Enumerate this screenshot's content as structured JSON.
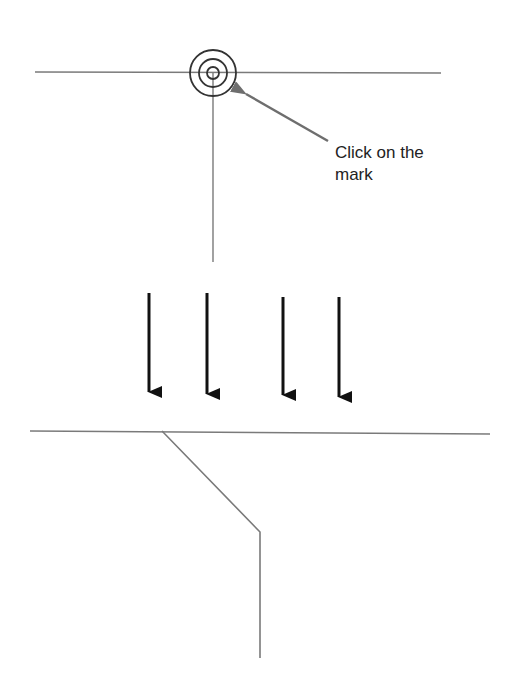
{
  "diagram": {
    "annotation": {
      "line1": "Click on the",
      "line2": "mark"
    },
    "elements": {
      "top_line": {
        "x1": 35,
        "y1": 72,
        "x2": 441,
        "y2": 73
      },
      "target_mark": {
        "cx": 213,
        "cy": 73,
        "radii": [
          23,
          14,
          6
        ]
      },
      "stem_line": {
        "x1": 213,
        "y1": 73,
        "x2": 213,
        "y2": 262
      },
      "pointer_arrow": {
        "x1": 328,
        "y1": 141,
        "x2": 240,
        "y2": 90
      },
      "down_arrows": [
        {
          "x": 149,
          "y1": 293,
          "y2": 405
        },
        {
          "x": 207,
          "y1": 293,
          "y2": 407
        },
        {
          "x": 283,
          "y1": 297,
          "y2": 408
        },
        {
          "x": 339,
          "y1": 297,
          "y2": 410
        }
      ],
      "bottom_line": {
        "x1": 30,
        "y1": 431,
        "x2": 490,
        "y2": 434
      },
      "bent_line": [
        [
          162,
          431
        ],
        [
          260,
          532
        ],
        [
          260,
          658
        ]
      ]
    },
    "colors": {
      "line": "#7a7a7a",
      "target": "#333333",
      "pointer": "#6e6e6e",
      "arrows": "#111111",
      "text": "#222222"
    }
  }
}
